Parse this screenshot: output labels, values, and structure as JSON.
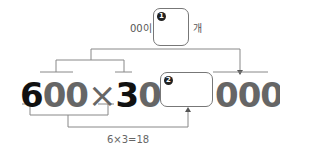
{
  "top_blank": {
    "prefix": "00",
    "prefix_suffix": "이",
    "badge": "1",
    "suffix": "개"
  },
  "expression": {
    "digit_a_highlight": "6",
    "digit_a_rest": "00",
    "times": "×",
    "digit_b_highlight": "3",
    "digit_b_rest": "0",
    "equals": "=",
    "blank_badge": "2",
    "trailing_zeros": "000"
  },
  "hint": {
    "calc": "6×3=18"
  },
  "colors": {
    "line": "#888888",
    "highlight": "#111111",
    "gray_digits": "#666666"
  }
}
